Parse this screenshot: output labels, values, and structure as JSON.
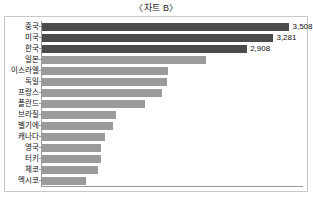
{
  "chart_title": "〈차트 B〉",
  "chart_data": {
    "type": "bar",
    "orientation": "horizontal",
    "title": "〈차트 B〉",
    "xlabel": "",
    "ylabel": "",
    "grid": false,
    "legend": false,
    "xlim": [
      0,
      3700
    ],
    "categories": [
      "중국",
      "미국",
      "한국",
      "일본",
      "이스라엘",
      "독일",
      "프랑스",
      "폴란드",
      "브라질",
      "벨기에",
      "캐나다",
      "영국",
      "터키",
      "체코",
      "멕시코"
    ],
    "values": [
      3508,
      3281,
      2908,
      2330,
      1790,
      1770,
      1700,
      1460,
      1050,
      1000,
      900,
      840,
      830,
      800,
      620
    ],
    "data_labels": [
      "3,508",
      "3,281",
      "2,908",
      "",
      "",
      "",
      "",
      "",
      "",
      "",
      "",
      "",
      "",
      "",
      ""
    ],
    "highlight_indices": [
      0,
      1,
      2
    ],
    "colors": {
      "bar_default": "#9b9b9b",
      "bar_highlight": "#4b4b4b",
      "axis": "#9a9a9a",
      "frame": "#c8c8c8",
      "text": "#111111",
      "background": "#ffffff"
    }
  }
}
